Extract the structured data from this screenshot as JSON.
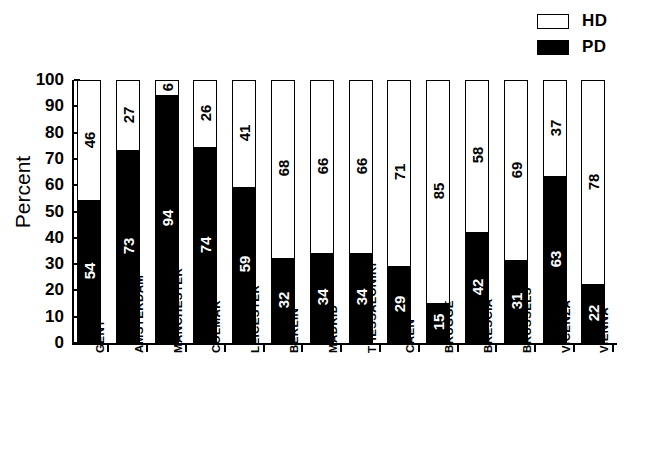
{
  "chart_data": {
    "type": "bar",
    "subtype": "stacked-100-percent",
    "title": "",
    "xlabel": "",
    "ylabel": "Percent",
    "ylim": [
      0,
      100
    ],
    "yticks": [
      0,
      10,
      20,
      30,
      40,
      50,
      60,
      70,
      80,
      90,
      100
    ],
    "grid": false,
    "legend_position": "top-right",
    "categories": [
      "GENT",
      "AMSTERDAM",
      "MANCHESTER",
      "COLMAR",
      "LEICESTER",
      "BERLIN",
      "MADRID",
      "THESSALONIKI",
      "CAEN",
      "BRUGGE",
      "BRESCIA",
      "BRUSSELS",
      "VICENZA",
      "VIENNA"
    ],
    "series": [
      {
        "name": "PD",
        "color": "#000000",
        "values": [
          54,
          73,
          94,
          74,
          59,
          32,
          34,
          34,
          29,
          15,
          42,
          31,
          63,
          22
        ]
      },
      {
        "name": "HD",
        "color": "#ffffff",
        "values": [
          46,
          27,
          6,
          26,
          41,
          68,
          66,
          66,
          71,
          85,
          58,
          69,
          37,
          78
        ]
      }
    ]
  },
  "legend": {
    "items": [
      {
        "label": "HD",
        "swatch": "open-rectangle"
      },
      {
        "label": "PD",
        "swatch": "filled-rectangle"
      }
    ]
  },
  "caption": ""
}
